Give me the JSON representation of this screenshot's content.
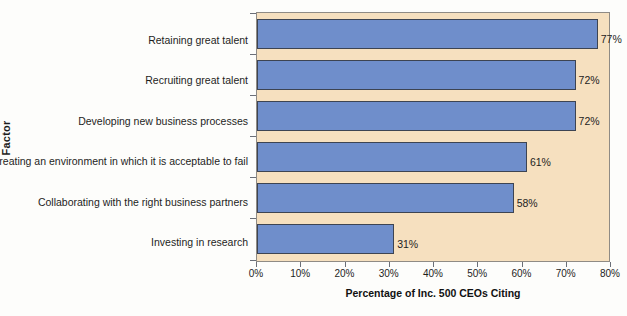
{
  "chart_data": {
    "type": "bar",
    "orientation": "horizontal",
    "title": "",
    "xlabel": "Percentage of Inc. 500 CEOs Citing",
    "ylabel": "Factor",
    "xlim": [
      0,
      80
    ],
    "xticks": [
      "0%",
      "10%",
      "20%",
      "30%",
      "40%",
      "50%",
      "60%",
      "70%",
      "80%"
    ],
    "xtick_values": [
      0,
      10,
      20,
      30,
      40,
      50,
      60,
      70,
      80
    ],
    "grid": false,
    "legend": null,
    "categories": [
      "Retaining great talent",
      "Recruiting great talent",
      "Developing new business processes",
      "Creating an environment in which it is acceptable  to fail",
      "Collaborating with the right business partners",
      "Investing in research"
    ],
    "values": [
      77,
      72,
      72,
      61,
      58,
      31
    ],
    "data_labels": [
      "77%",
      "72%",
      "72%",
      "61%",
      "58%",
      "31%"
    ],
    "colors": {
      "bar_fill": "#6f8ecb",
      "bar_border": "#3d4452",
      "plot_background": "#f6e0bf",
      "plot_border": "#8f8b85",
      "figure_background": "#fdfdfb",
      "text": "#1d1d1d"
    }
  }
}
